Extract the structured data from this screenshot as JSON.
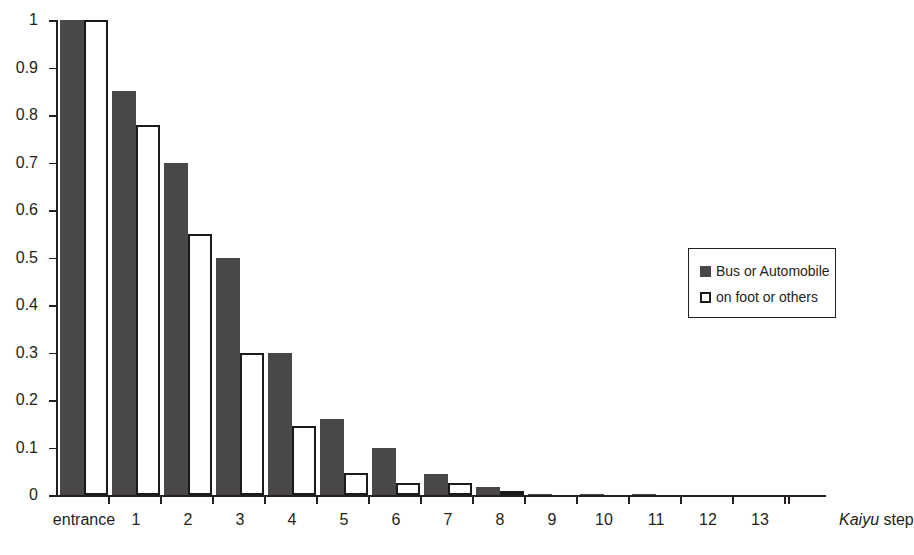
{
  "chart_data": {
    "type": "bar",
    "title": "",
    "xlabel": "Kaiyu step",
    "xlabel_italic_part": "Kaiyu",
    "xlabel_plain_part": "step",
    "ylabel": "Probability",
    "ylim": [
      0,
      1
    ],
    "ytick_labels": [
      "0",
      "0.1",
      "0.2",
      "0.3",
      "0.4",
      "0.5",
      "0.6",
      "0.7",
      "0.8",
      "0.9",
      "1"
    ],
    "ytick_values": [
      0,
      0.1,
      0.2,
      0.3,
      0.4,
      0.5,
      0.6,
      0.7,
      0.8,
      0.9,
      1
    ],
    "categories": [
      "entrance",
      "1",
      "2",
      "3",
      "4",
      "5",
      "6",
      "7",
      "8",
      "9",
      "10",
      "11",
      "12",
      "13"
    ],
    "grid": false,
    "legend_position": "right-center",
    "series": [
      {
        "name": "Bus or Automobile",
        "color": "#4a4749",
        "style": "filled",
        "values": [
          1.0,
          0.85,
          0.7,
          0.5,
          0.3,
          0.16,
          0.1,
          0.045,
          0.017,
          0.004,
          0.002,
          0.001,
          0.0,
          0.0
        ]
      },
      {
        "name": "on foot or others",
        "color": "#ffffff",
        "style": "outlined",
        "values": [
          1.0,
          0.78,
          0.55,
          0.3,
          0.145,
          0.047,
          0.027,
          0.026,
          0.006,
          0.0,
          0.0,
          0.0,
          0.0,
          0.0
        ]
      }
    ]
  },
  "axes": {
    "y_title": "Probability",
    "x_title_italic": "Kaiyu",
    "x_title_rest": "step"
  },
  "legend": {
    "items": [
      {
        "label": "Bus or Automobile",
        "swatch": "filled-dark-square"
      },
      {
        "label": "on foot or others",
        "swatch": "outlined-white-square"
      }
    ]
  },
  "colors": {
    "series_dark": "#4a4749",
    "series_open_fill": "#ffffff",
    "series_open_stroke": "#1a1a1a",
    "axis": "#231f20",
    "background": "#ffffff"
  }
}
